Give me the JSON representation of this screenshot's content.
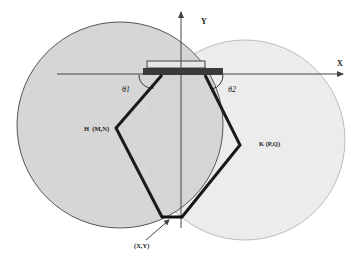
{
  "diagram": {
    "type": "five-bar parallel planar mechanism workspace",
    "axes": {
      "x_label": "X",
      "y_label": "Y"
    },
    "angles": {
      "left": "θ1",
      "right": "θ2"
    },
    "joints": {
      "left_elbow": "H  (M,N)",
      "right_elbow": "K (P,Q)",
      "end_effector": "(X,Y)"
    },
    "workspace_circles": [
      {
        "name": "left-reach-circle",
        "fill": "#d4d4d4",
        "stroke": "#555555"
      },
      {
        "name": "right-reach-circle",
        "fill": "#ececec",
        "stroke": "#bdbdbd"
      }
    ],
    "colors": {
      "link": "#1a1a1a",
      "base": "#3a3a3a",
      "axis": "#444444"
    }
  }
}
